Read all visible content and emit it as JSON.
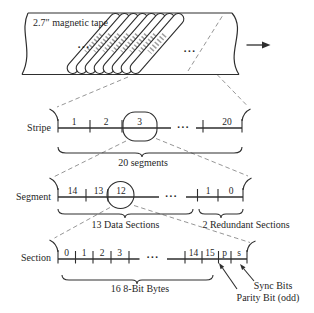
{
  "figure": {
    "title_meaning": "Magnetic tape layout: stripe, segment, section hierarchy",
    "colors": {
      "ink": "#2e2e2e",
      "dash_gray": "#8a8a8a",
      "paper": "#ffffff",
      "scribble_gray": "#9e9e9e"
    },
    "tape": {
      "label": "2.7″ magnetic tape",
      "dots_left": "...",
      "dots_right": "...",
      "motion_arrow_icon": "right-arrow"
    },
    "stripe_row": {
      "label": "Stripe",
      "cells": [
        "1",
        "2",
        "3",
        "20"
      ],
      "dots": "...",
      "highlighted_cell": "3",
      "brace_label": "20 segments"
    },
    "segment_row": {
      "label": "Segment",
      "cells": [
        "14",
        "13",
        "12",
        "1",
        "0"
      ],
      "dots": "...",
      "highlighted_cell": "12",
      "brace_left_label": "13 Data Sections",
      "brace_right_label": "2 Redundant Sections"
    },
    "section_row": {
      "label": "Section",
      "cells": [
        "0",
        "1",
        "2",
        "3",
        "14",
        "15",
        "p",
        "s"
      ],
      "dots": "...",
      "brace_label": "16 8-Bit Bytes",
      "sync_label": "Sync Bits",
      "parity_label": "Parity Bit (odd)"
    }
  }
}
